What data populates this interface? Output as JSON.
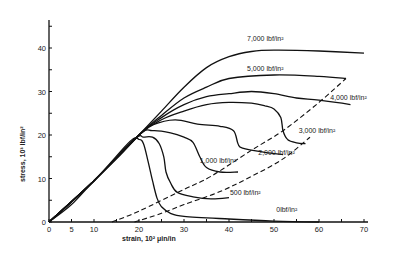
{
  "chart_data": {
    "type": "line",
    "title": "",
    "xlabel": "strain, 10² μin/in",
    "ylabel": "stress, 10³ lbf/in²",
    "xlim": [
      0,
      70
    ],
    "ylim": [
      0,
      47
    ],
    "x_ticks": [
      0,
      5,
      10,
      20,
      30,
      40,
      50,
      60,
      70
    ],
    "x_minor_ticks": [
      15,
      25,
      35,
      45,
      55,
      65
    ],
    "y_ticks": [
      0,
      10,
      20,
      30,
      40
    ],
    "y_minor_ticks": [
      5,
      15,
      25,
      35,
      45
    ],
    "grid": false,
    "legend": "inline labels",
    "series": [
      {
        "name": "7,000 lbf/in²",
        "label": "7,000 lbf/in²",
        "label_pos": [
          44,
          41.5
        ],
        "points": [
          [
            0,
            0
          ],
          [
            5,
            4
          ],
          [
            10,
            9.5
          ],
          [
            15,
            14.5
          ],
          [
            20,
            20
          ],
          [
            25,
            25.5
          ],
          [
            30,
            31
          ],
          [
            35,
            35.5
          ],
          [
            40,
            38
          ],
          [
            45,
            39.2
          ],
          [
            50,
            39.5
          ],
          [
            60,
            39.3
          ],
          [
            70,
            38.8
          ]
        ]
      },
      {
        "name": "5,000 lbf/in²",
        "label": "5,000 lbf/in²",
        "label_pos": [
          44,
          34.8
        ],
        "points": [
          [
            0,
            0
          ],
          [
            10,
            9.5
          ],
          [
            20,
            20
          ],
          [
            25,
            24.5
          ],
          [
            30,
            28.5
          ],
          [
            35,
            31
          ],
          [
            40,
            33
          ],
          [
            50,
            33.8
          ],
          [
            60,
            33.5
          ],
          [
            66,
            33
          ]
        ]
      },
      {
        "name": "4,000 lbf/in²",
        "label": "4,000 lbf/in²",
        "label_pos": [
          62.5,
          28
        ],
        "points": [
          [
            0,
            0
          ],
          [
            10,
            9.5
          ],
          [
            20,
            20
          ],
          [
            25,
            24
          ],
          [
            30,
            27
          ],
          [
            35,
            28.8
          ],
          [
            40,
            29.5
          ],
          [
            45,
            30
          ],
          [
            50,
            29.5
          ],
          [
            55,
            28.5
          ],
          [
            60,
            28
          ],
          [
            67,
            27
          ]
        ]
      },
      {
        "name": "3,000 lbf/in²",
        "label": "3,000 lbf/in²",
        "label_pos": [
          55.5,
          20.5
        ],
        "points": [
          [
            0,
            0
          ],
          [
            10,
            9.5
          ],
          [
            20,
            20
          ],
          [
            25,
            23.5
          ],
          [
            30,
            25.5
          ],
          [
            35,
            27
          ],
          [
            40,
            27.5
          ],
          [
            45,
            27.3
          ],
          [
            48,
            26.7
          ],
          [
            50,
            26
          ],
          [
            51.5,
            24
          ],
          [
            52,
            21
          ],
          [
            53,
            19
          ],
          [
            55,
            18.2
          ],
          [
            57,
            18
          ]
        ]
      },
      {
        "name": "2,000 lbf/in²",
        "label": "2,000 lbf/in²",
        "label_pos": [
          46.5,
          15.5
        ],
        "points": [
          [
            0,
            0
          ],
          [
            10,
            9.5
          ],
          [
            20,
            20
          ],
          [
            23,
            22.3
          ],
          [
            28,
            23.5
          ],
          [
            33,
            22.5
          ],
          [
            38,
            22
          ],
          [
            41,
            21
          ],
          [
            42,
            18
          ],
          [
            43,
            17
          ],
          [
            48,
            16
          ],
          [
            52,
            15.5
          ]
        ]
      },
      {
        "name": "1,000 lbf/in²",
        "label": "1,000 lbf/in²",
        "label_pos": [
          33.5,
          13.5
        ],
        "points": [
          [
            0,
            0
          ],
          [
            10,
            9.5
          ],
          [
            20,
            20
          ],
          [
            23,
            21
          ],
          [
            27,
            20.5
          ],
          [
            30,
            19.5
          ],
          [
            32,
            18.3
          ],
          [
            33.5,
            15
          ],
          [
            35,
            12.5
          ],
          [
            38,
            11.5
          ],
          [
            42,
            11.5
          ]
        ]
      },
      {
        "name": "500 lbf/in²",
        "label": "500 lbf/in²",
        "label_pos": [
          40.2,
          6.3
        ],
        "points": [
          [
            0,
            0
          ],
          [
            10,
            9.5
          ],
          [
            19,
            19
          ],
          [
            21,
            19.5
          ],
          [
            23,
            19.5
          ],
          [
            24.5,
            18
          ],
          [
            25.5,
            15
          ],
          [
            26,
            11.5
          ],
          [
            27,
            9
          ],
          [
            28.5,
            6.8
          ],
          [
            32,
            5.8
          ],
          [
            36,
            5.3
          ],
          [
            40,
            5.6
          ]
        ]
      },
      {
        "name": "0 lbf/in²",
        "label": "0lbf/in²",
        "label_pos": [
          50.5,
          2.4
        ],
        "points": [
          [
            0,
            0
          ],
          [
            10,
            9.5
          ],
          [
            18,
            18.5
          ],
          [
            20,
            19
          ],
          [
            21,
            18
          ],
          [
            22,
            14
          ],
          [
            23,
            9.5
          ],
          [
            24,
            5.5
          ],
          [
            25,
            3.5
          ],
          [
            27,
            2
          ],
          [
            30,
            1.3
          ],
          [
            40,
            0.7
          ],
          [
            50,
            0.2
          ],
          [
            60,
            0
          ]
        ]
      }
    ],
    "dashed_envelopes": [
      {
        "name": "upper envelope",
        "points": [
          [
            14,
            0
          ],
          [
            20,
            2.5
          ],
          [
            30,
            7.5
          ],
          [
            36,
            10.5
          ],
          [
            45,
            16.5
          ],
          [
            52,
            21
          ],
          [
            60,
            27.5
          ],
          [
            66,
            33
          ]
        ]
      },
      {
        "name": "lower envelope",
        "points": [
          [
            19,
            0
          ],
          [
            25,
            2
          ],
          [
            30,
            4
          ],
          [
            38,
            7
          ],
          [
            45,
            10.5
          ],
          [
            52,
            14.5
          ],
          [
            58,
            19.5
          ]
        ]
      }
    ]
  }
}
